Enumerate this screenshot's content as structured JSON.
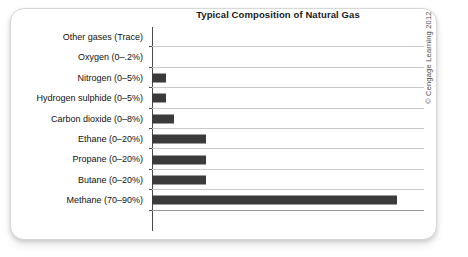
{
  "figure": {
    "credit": "© Cengage Learning 2012"
  },
  "chart_data": {
    "type": "bar",
    "orientation": "horizontal",
    "title": "Typical Composition of Natural Gas",
    "xlabel": "",
    "ylabel": "",
    "xlim": [
      0,
      100
    ],
    "grid": "horizontal row separators only",
    "legend": "none",
    "axis_tick_labels": [],
    "categories": [
      "Other gases (Trace)",
      "Oxygen (0–.2%)",
      "Nitrogen (0–5%)",
      "Hydrogen sulphide (0–5%)",
      "Carbon dioxide (0–8%)",
      "Ethane (0–20%)",
      "Propane (0–20%)",
      "Butane (0–20%)",
      "Methane (70–90%)"
    ],
    "values": [
      0,
      0,
      5,
      5,
      8,
      20,
      20,
      20,
      90
    ],
    "ranges": [
      {
        "label": "Other gases (Trace)",
        "min": 0,
        "max": 0,
        "note": "Trace"
      },
      {
        "label": "Oxygen (0–.2%)",
        "min": 0,
        "max": 0.2
      },
      {
        "label": "Nitrogen (0–5%)",
        "min": 0,
        "max": 5
      },
      {
        "label": "Hydrogen sulphide (0–5%)",
        "min": 0,
        "max": 5
      },
      {
        "label": "Carbon dioxide (0–8%)",
        "min": 0,
        "max": 8
      },
      {
        "label": "Ethane (0–20%)",
        "min": 0,
        "max": 20
      },
      {
        "label": "Propane (0–20%)",
        "min": 0,
        "max": 20
      },
      {
        "label": "Butane (0–20%)",
        "min": 0,
        "max": 20
      },
      {
        "label": "Methane (70–90%)",
        "min": 70,
        "max": 90
      }
    ],
    "bar_color": "#3b3b3b",
    "background_color": "#ffffff",
    "gridline_color": "#c9c9c9"
  }
}
